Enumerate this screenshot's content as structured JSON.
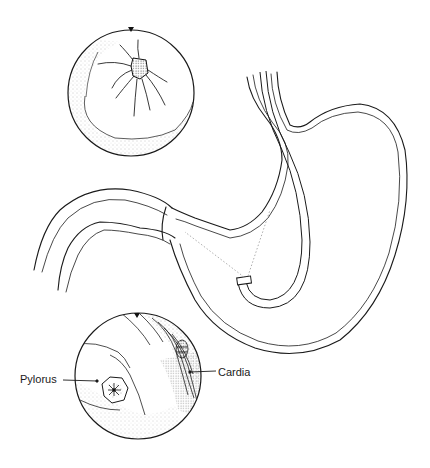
{
  "figure": {
    "type": "anatomical line illustration",
    "stroke_color": "#1a1a1a",
    "stipple_color": "#444444",
    "background": "#ffffff"
  },
  "insets": [
    {
      "id": "top-inset",
      "view": "endoscopic view (pylorus, en face)"
    },
    {
      "id": "bottom-inset",
      "view": "endoscopic view (retroflexed)"
    }
  ],
  "labels": {
    "pylorus": "Pylorus",
    "cardia": "Cardia"
  }
}
